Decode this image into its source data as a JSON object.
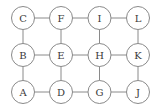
{
  "diagram": {
    "type": "grid-graph",
    "rows": 3,
    "columns": 4,
    "colors": {
      "edge": "#8a8a8a",
      "node_stroke": "#8a8a8a",
      "node_fill": "#ffffff",
      "label": "#3a3a3a"
    },
    "nodes": [
      {
        "id": "A",
        "label": "A",
        "row": 2,
        "col": 0
      },
      {
        "id": "B",
        "label": "B",
        "row": 1,
        "col": 0
      },
      {
        "id": "C",
        "label": "C",
        "row": 0,
        "col": 0
      },
      {
        "id": "D",
        "label": "D",
        "row": 2,
        "col": 1
      },
      {
        "id": "E",
        "label": "E",
        "row": 1,
        "col": 1
      },
      {
        "id": "F",
        "label": "F",
        "row": 0,
        "col": 1
      },
      {
        "id": "G",
        "label": "G",
        "row": 2,
        "col": 2
      },
      {
        "id": "H",
        "label": "H",
        "row": 1,
        "col": 2
      },
      {
        "id": "I",
        "label": "I",
        "row": 0,
        "col": 2
      },
      {
        "id": "J",
        "label": "J",
        "row": 2,
        "col": 3
      },
      {
        "id": "K",
        "label": "K",
        "row": 1,
        "col": 3
      },
      {
        "id": "L",
        "label": "L",
        "row": 0,
        "col": 3
      }
    ],
    "edges": [
      [
        "C",
        "F"
      ],
      [
        "F",
        "I"
      ],
      [
        "I",
        "L"
      ],
      [
        "B",
        "E"
      ],
      [
        "E",
        "H"
      ],
      [
        "H",
        "K"
      ],
      [
        "A",
        "D"
      ],
      [
        "D",
        "G"
      ],
      [
        "G",
        "J"
      ],
      [
        "C",
        "B"
      ],
      [
        "B",
        "A"
      ],
      [
        "F",
        "E"
      ],
      [
        "E",
        "D"
      ],
      [
        "I",
        "H"
      ],
      [
        "H",
        "G"
      ],
      [
        "L",
        "K"
      ],
      [
        "K",
        "J"
      ]
    ]
  }
}
